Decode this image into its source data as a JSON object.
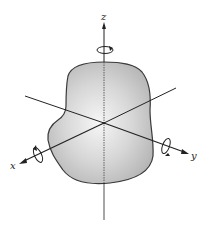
{
  "diagram": {
    "axes": [
      {
        "id": "x",
        "label": "x"
      },
      {
        "id": "y",
        "label": "y"
      },
      {
        "id": "z",
        "label": "z"
      }
    ],
    "colors": {
      "body_fill_center": "#f4f4f4",
      "body_fill_edge": "#b8b8b8",
      "outline": "#3a3a3a",
      "axis": "#222222",
      "background": "#ffffff"
    }
  }
}
